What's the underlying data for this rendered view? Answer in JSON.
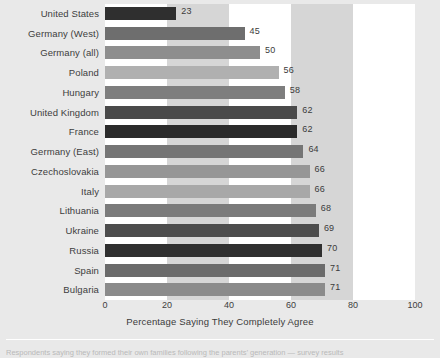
{
  "chart_data": {
    "type": "bar",
    "orientation": "horizontal",
    "title": "",
    "xlabel": "Percentage Saying They Completely Agree",
    "ylabel": "",
    "xlim": [
      0,
      100
    ],
    "xticks": [
      0,
      20,
      40,
      60,
      80,
      100
    ],
    "xtick_labels": [
      "0",
      "20",
      "40",
      "60",
      "80",
      "100"
    ],
    "grid": false,
    "banding": "alternating vertical bands: white 0-20, gray 20-40, white 40-60, gray 60-80, white 80-100",
    "legend": null,
    "categories": [
      "United States",
      "Germany (West)",
      "Germany (all)",
      "Poland",
      "Hungary",
      "United Kingdom",
      "France",
      "Germany (East)",
      "Czechoslovakia",
      "Italy",
      "Lithuania",
      "Ukraine",
      "Russia",
      "Spain",
      "Bulgaria"
    ],
    "values": [
      23,
      45,
      50,
      56,
      58,
      62,
      62,
      64,
      66,
      66,
      68,
      69,
      70,
      71,
      71
    ],
    "value_labels": [
      "23",
      "45",
      "50",
      "56",
      "58",
      "62",
      "62",
      "64",
      "66",
      "66",
      "68",
      "69",
      "70",
      "71",
      "71"
    ],
    "bar_colors": [
      "#2f2f2f",
      "#6e6e6e",
      "#8e8e8e",
      "#b0b0b0",
      "#7e7e7e",
      "#4a4a4a",
      "#2b2b2b",
      "#757575",
      "#969696",
      "#a8a8a8",
      "#7b7b7b",
      "#4d4d4d",
      "#303030",
      "#6b6b6b",
      "#8b8b8b"
    ]
  },
  "axis": {
    "title": "Percentage Saying They Completely Agree",
    "ticks": [
      "0",
      "20",
      "40",
      "60",
      "80",
      "100"
    ]
  },
  "caption": {
    "text": "Respondents saying they formed their own families following the parents’ generation  —  survey results"
  },
  "colors": {
    "page_background": "#e9e9e9",
    "band_light": "#ffffff",
    "band_dark": "#d6d6d6",
    "text": "#3d3d3d"
  }
}
